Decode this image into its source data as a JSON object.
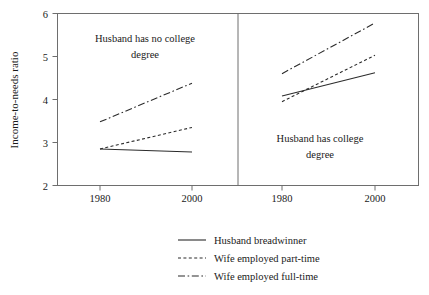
{
  "chart_data": {
    "type": "line",
    "title": "",
    "subtitle": "",
    "xlabel": "",
    "ylabel": "Income-to-needs ratio",
    "x": [
      1980,
      2000
    ],
    "xtick_labels": [
      "1980",
      "2000"
    ],
    "ytick_labels": [
      "2",
      "3",
      "4",
      "5",
      "6"
    ],
    "yticks": [
      2,
      3,
      4,
      5,
      6
    ],
    "ylim": [
      2,
      6
    ],
    "xlim": [
      1972,
      2008
    ],
    "grid": false,
    "legend_position": "bottom-center",
    "panels": [
      {
        "id": "no-college",
        "label_line1": "Husband has no college",
        "label_line2": "degree",
        "series": [
          {
            "name": "Husband breadwinner",
            "style": "solid",
            "values": [
              2.85,
              2.78
            ]
          },
          {
            "name": "Wife employed part-time",
            "style": "dashed",
            "values": [
              2.85,
              3.35
            ]
          },
          {
            "name": "Wife employed full-time",
            "style": "dashdot",
            "values": [
              3.48,
              4.38
            ]
          }
        ]
      },
      {
        "id": "college",
        "label_line1": "Husband has college",
        "label_line2": "degree",
        "series": [
          {
            "name": "Husband breadwinner",
            "style": "solid",
            "values": [
              4.08,
              4.62
            ]
          },
          {
            "name": "Wife employed part-time",
            "style": "dashed",
            "values": [
              3.95,
              5.03
            ]
          },
          {
            "name": "Wife employed full-time",
            "style": "dashdot",
            "values": [
              4.6,
              5.78
            ]
          }
        ]
      }
    ],
    "legend": [
      {
        "label": "Husband breadwinner",
        "style": "solid"
      },
      {
        "label": "Wife employed part-time",
        "style": "dashed"
      },
      {
        "label": "Wife employed full-time",
        "style": "dashdot"
      }
    ],
    "colors": {
      "line": "#2b2b2b",
      "frame": "#6e6e6e",
      "text": "#1a1a1a",
      "background": "#ffffff"
    }
  },
  "axis": {
    "ylabel": "Income-to-needs ratio",
    "ytick_0": "2",
    "ytick_1": "3",
    "ytick_2": "4",
    "ytick_3": "5",
    "ytick_4": "6",
    "xtick_left_0": "1980",
    "xtick_left_1": "2000",
    "xtick_right_0": "1980",
    "xtick_right_1": "2000"
  },
  "panel_left": {
    "label_line1": "Husband has no college",
    "label_line2": "degree"
  },
  "panel_right": {
    "label_line1": "Husband has college",
    "label_line2": "degree"
  },
  "legend": {
    "item_0": "Husband breadwinner",
    "item_1": "Wife employed part-time",
    "item_2": "Wife employed full-time"
  }
}
